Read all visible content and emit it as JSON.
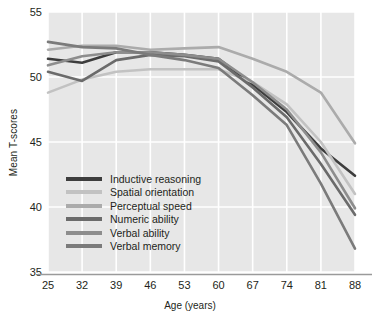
{
  "chart_data": {
    "type": "line",
    "title": "",
    "xlabel": "Age (years)",
    "ylabel": "Mean T-scores",
    "x": [
      25,
      32,
      39,
      46,
      53,
      60,
      67,
      74,
      81,
      88
    ],
    "categories": [
      "25",
      "32",
      "39",
      "46",
      "53",
      "60",
      "67",
      "74",
      "81",
      "88"
    ],
    "xtick_labels": [
      "25",
      "32",
      "39",
      "46",
      "53",
      "60",
      "67",
      "74",
      "81",
      "88"
    ],
    "ytick_labels": [
      "35",
      "40",
      "45",
      "50",
      "55"
    ],
    "yticks": [
      35,
      40,
      45,
      50,
      55
    ],
    "xlim": [
      25,
      88
    ],
    "ylim": [
      35,
      55
    ],
    "grid": true,
    "legend_position": "inside-lower-left",
    "plot_background": "#e7e7e7",
    "gridline_color": "#ffffff",
    "series": [
      {
        "name": "Inductive reasoning",
        "color": "#3d3d3d",
        "values": [
          51.4,
          51.1,
          51.9,
          51.9,
          51.7,
          51.4,
          49.4,
          47.3,
          44.5,
          42.4
        ]
      },
      {
        "name": "Spatial orientation",
        "color": "#c2c2c2",
        "values": [
          48.8,
          49.8,
          50.4,
          50.6,
          50.6,
          50.6,
          49.6,
          47.9,
          45.0,
          41.0
        ]
      },
      {
        "name": "Perceptual speed",
        "color": "#ababab",
        "values": [
          52.1,
          52.4,
          52.4,
          52.1,
          52.2,
          52.3,
          51.4,
          50.4,
          48.8,
          44.9
        ]
      },
      {
        "name": "Numeric ability",
        "color": "#6b6b6b",
        "values": [
          50.4,
          49.7,
          51.3,
          51.7,
          51.6,
          51.2,
          49.2,
          46.9,
          43.3,
          39.4
        ]
      },
      {
        "name": "Verbal ability",
        "color": "#8d8d8d",
        "values": [
          50.9,
          51.6,
          51.9,
          51.9,
          51.7,
          51.4,
          49.6,
          47.5,
          44.2,
          39.9
        ]
      },
      {
        "name": "Verbal memory",
        "color": "#7b7b7b",
        "values": [
          52.7,
          52.3,
          52.2,
          51.7,
          51.3,
          50.7,
          48.6,
          46.3,
          41.8,
          36.8
        ]
      }
    ]
  },
  "legend": {
    "items": [
      {
        "label": "Inductive reasoning",
        "color": "#3d3d3d"
      },
      {
        "label": "Spatial orientation",
        "color": "#c2c2c2"
      },
      {
        "label": "Perceptual speed",
        "color": "#ababab"
      },
      {
        "label": "Numeric ability",
        "color": "#6b6b6b"
      },
      {
        "label": "Verbal ability",
        "color": "#8d8d8d"
      },
      {
        "label": "Verbal memory",
        "color": "#7b7b7b"
      }
    ]
  }
}
